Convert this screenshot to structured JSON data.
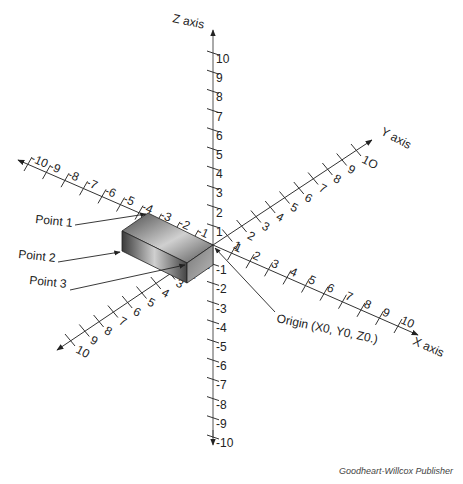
{
  "figure": {
    "credit": "Goodheart-Willcox Publisher",
    "origin_label": "Origin (X0, Y0, Z0.)",
    "axes": {
      "z": {
        "title": "Z axis",
        "positive_ticks": [
          "1",
          "2",
          "3",
          "4",
          "5",
          "6",
          "7",
          "8",
          "9",
          "10"
        ],
        "negative_ticks": [
          "-1",
          "-2",
          "-3",
          "-4",
          "-5",
          "-6",
          "-7",
          "-8",
          "-9",
          "-10"
        ]
      },
      "x": {
        "title": "X axis",
        "positive_ticks": [
          "1",
          "2",
          "3",
          "4",
          "5",
          "6",
          "7",
          "8",
          "9",
          "10"
        ],
        "negative_ticks": [
          "-1",
          "-2",
          "-3",
          "-4",
          "-5",
          "-6",
          "-7",
          "-8",
          "-9",
          "-10"
        ]
      },
      "y": {
        "title": "Y axis",
        "positive_ticks": [
          "1",
          "2",
          "3",
          "4",
          "5",
          "6",
          "7",
          "8",
          "9",
          "1O"
        ],
        "negative_ticks": [
          "1",
          "2",
          "3",
          "4",
          "5",
          "6",
          "7",
          "8",
          "9",
          "10"
        ]
      }
    },
    "callouts": [
      {
        "label": "Point 1"
      },
      {
        "label": "Point 2"
      },
      {
        "label": "Point 3"
      }
    ],
    "colors": {
      "line": "#222222",
      "block_dark": "#3a3a3a",
      "block_light": "#d8d8d8"
    }
  }
}
